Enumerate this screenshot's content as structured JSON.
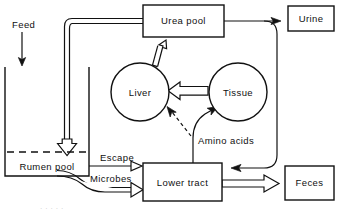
{
  "diagram": {
    "nodes": [
      {
        "id": "urea_pool",
        "label": "Urea pool",
        "shape": "box"
      },
      {
        "id": "urine",
        "label": "Urine",
        "shape": "box"
      },
      {
        "id": "liver",
        "label": "Liver",
        "shape": "circle"
      },
      {
        "id": "tissue",
        "label": "Tissue",
        "shape": "circle"
      },
      {
        "id": "rumen_pool",
        "label": "Rumen pool",
        "shape": "open-box"
      },
      {
        "id": "lower_tract",
        "label": "Lower tract",
        "shape": "box"
      },
      {
        "id": "feces",
        "label": "Feces",
        "shape": "box"
      }
    ],
    "edge_labels": [
      {
        "id": "feed",
        "label": "Feed"
      },
      {
        "id": "escape",
        "label": "Escape"
      },
      {
        "id": "microbes",
        "label": "Microbes"
      },
      {
        "id": "amino_acids",
        "label": "Amino acids"
      }
    ],
    "edges": [
      {
        "from": "feed",
        "to": "rumen_pool",
        "style": "thin-arrow"
      },
      {
        "from": "urea_pool",
        "to": "rumen_pool",
        "style": "hollow-arrow"
      },
      {
        "from": "urea_pool",
        "to": "urine",
        "style": "thin-arrow"
      },
      {
        "from": "urea_pool",
        "to": "lower_tract",
        "style": "thin-arrow-curve"
      },
      {
        "from": "liver",
        "to": "urea_pool",
        "style": "hollow-arrow"
      },
      {
        "from": "tissue",
        "to": "liver",
        "style": "hollow-arrow"
      },
      {
        "from": "lower_tract",
        "to": "tissue",
        "style": "thin-arrow"
      },
      {
        "from": "lower_tract",
        "to": "liver",
        "style": "dashed-arrow"
      },
      {
        "from": "rumen_pool",
        "to": "lower_tract",
        "style": "thin-arrow",
        "label": "Escape"
      },
      {
        "from": "rumen_pool",
        "to": "lower_tract",
        "style": "hollow-arrow",
        "label": "Microbes"
      },
      {
        "from": "lower_tract",
        "to": "feces",
        "style": "hollow-arrow"
      }
    ],
    "colors": {
      "stroke": "#111111",
      "fill": "#ffffff",
      "text": "#101010"
    }
  }
}
